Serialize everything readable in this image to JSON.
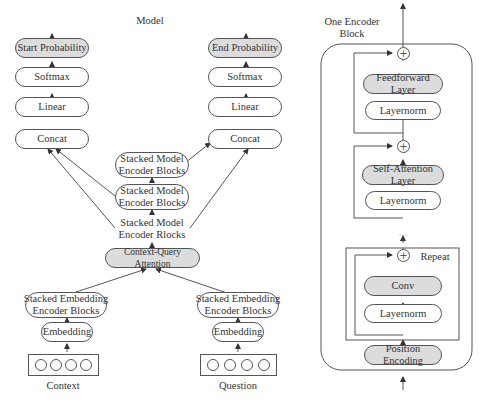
{
  "model": {
    "title": "Model",
    "start_branch": {
      "output": "Start Probability",
      "softmax": "Softmax",
      "linear": "Linear",
      "concat": "Concat"
    },
    "end_branch": {
      "output": "End Probability",
      "softmax": "Softmax",
      "linear": "Linear",
      "concat": "Concat"
    },
    "model_encoders": [
      "Stacked Model\nEncoder Blocks",
      "Stacked Model\nEncoder Blocks",
      "Stacked Model\nEncoder Rlocks"
    ],
    "attention": "Context-Query Attention",
    "context": {
      "encoder": "Stacked Embedding\nEncoder Blocks",
      "embedding": "Embedding",
      "label": "Context"
    },
    "question": {
      "encoder": "Stacked Embedding\nEncoder Blocks",
      "embedding": "Embedding",
      "label": "Question"
    }
  },
  "encoder_block": {
    "title": "One Encoder\nBlock",
    "feedforward": "Feedforward Layer",
    "layernorm_1": "Layernorm",
    "self_attention": "Self-Attention Layer",
    "layernorm_2": "Layernorm",
    "ellipsis": "...",
    "repeat_label": "Repeat",
    "conv": "Conv",
    "layernorm_3": "Layernorm",
    "position_encoding": "Position Encoding",
    "plus_symbol": "+"
  }
}
